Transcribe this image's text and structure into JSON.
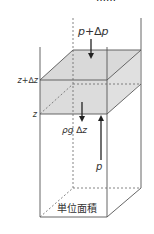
{
  "figure": {
    "title_partial": "……",
    "labels": {
      "top_pressure": "p+∆p",
      "upper_height": "z+∆z",
      "lower_height": "z",
      "weight": "ρg ∆z",
      "bottom_pressure": "p",
      "base_area": "単位面積"
    },
    "colors": {
      "line": "#555555",
      "slab_fill": "#d9d9d9",
      "arrow": "#222222",
      "text": "#333333"
    }
  }
}
